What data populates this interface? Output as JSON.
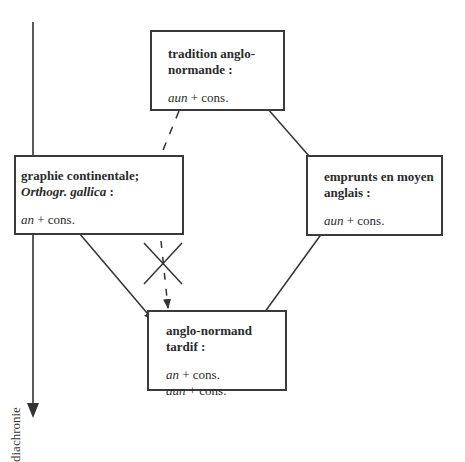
{
  "diagram": {
    "axis": {
      "label": "diachronie",
      "direction": "down"
    },
    "nodes": {
      "top": {
        "title_line1": "tradition anglo-",
        "title_line2": "normande :",
        "form1_italic": "aun",
        "form1_rest": " + cons."
      },
      "left": {
        "title_line1": "graphie continentale;",
        "title_line2_italic": "Orthogr. gallica",
        "title_line2_rest": " :",
        "form1_italic": "an",
        "form1_rest": " + cons."
      },
      "right": {
        "title_line1": "emprunts en moyen",
        "title_line2": "anglais :",
        "form1_italic": "aun",
        "form1_rest": " + cons."
      },
      "bottom": {
        "title_line1": "anglo-normand",
        "title_line2": "tardif :",
        "form1_italic": "an",
        "form1_rest": " + cons.",
        "form2_italic": "aun",
        "form2_rest": " + cons."
      }
    },
    "edges": [
      {
        "from": "top",
        "to": "right",
        "style": "solid",
        "arrow": true
      },
      {
        "from": "top",
        "to": "left",
        "style": "dashed",
        "arrow": false
      },
      {
        "from": "left",
        "to": "bottom",
        "style": "solid",
        "arrow": true
      },
      {
        "from": "left",
        "to": "bottom",
        "style": "dashed",
        "arrow": true,
        "crossed_out": true
      },
      {
        "from": "right",
        "to": "bottom",
        "style": "solid",
        "arrow": true
      }
    ],
    "colors": {
      "line": "#3a3a3a",
      "background": "#ffffff"
    }
  }
}
